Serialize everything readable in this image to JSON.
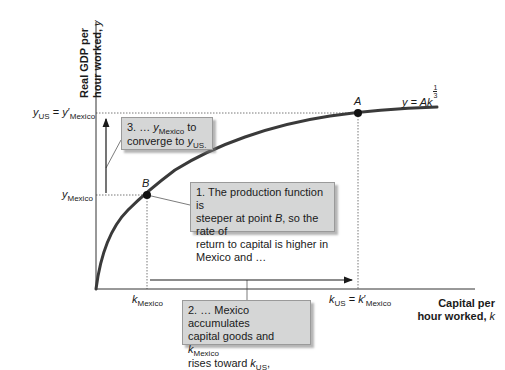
{
  "axes": {
    "y_title_line1": "Real GDP per",
    "y_title_line2": "hour worked,",
    "y_title_var": "y",
    "x_title_line1": "Capital per",
    "x_title_line2": "hour worked,",
    "x_title_var": "k"
  },
  "y_ticks": {
    "us": {
      "var": "y",
      "sub": "US",
      "eq": " = ",
      "var2": "y",
      "prime": "′",
      "sub2": "Mexico"
    },
    "mexico": {
      "var": "y",
      "sub": "Mexico"
    }
  },
  "x_ticks": {
    "mexico": {
      "var": "k",
      "sub": "Mexico"
    },
    "us": {
      "var": "k",
      "sub": "US",
      "eq": " = ",
      "var2": "k",
      "prime": "′",
      "sub2": "Mexico"
    }
  },
  "curve": {
    "label_lhs": "y = Ak",
    "exp_num": "1",
    "exp_den": "3",
    "color": "#3a3a3a"
  },
  "points": {
    "a": {
      "label": "A"
    },
    "b": {
      "label": "B"
    }
  },
  "callouts": {
    "one": {
      "line1": "1. The production function is",
      "line2_pre": "steeper at point ",
      "line2_var": "B",
      "line2_post": ", so the rate of",
      "line3": "return to capital is higher in",
      "line4": "Mexico and …"
    },
    "two": {
      "line1": "2. … Mexico accumulates",
      "line2_pre": "capital goods and ",
      "line2_var": "k",
      "line2_sub": "Mexico",
      "line3_pre": "rises toward ",
      "line3_var": "k",
      "line3_sub": "US",
      "line3_post": ", causing …"
    },
    "three": {
      "line1_pre": "3. … ",
      "line1_var": "y",
      "line1_sub": "Mexico",
      "line1_post": " to",
      "line2_pre": "converge to ",
      "line2_var": "y",
      "line2_sub": "US."
    },
    "fill_color": "#d5d6d6"
  }
}
